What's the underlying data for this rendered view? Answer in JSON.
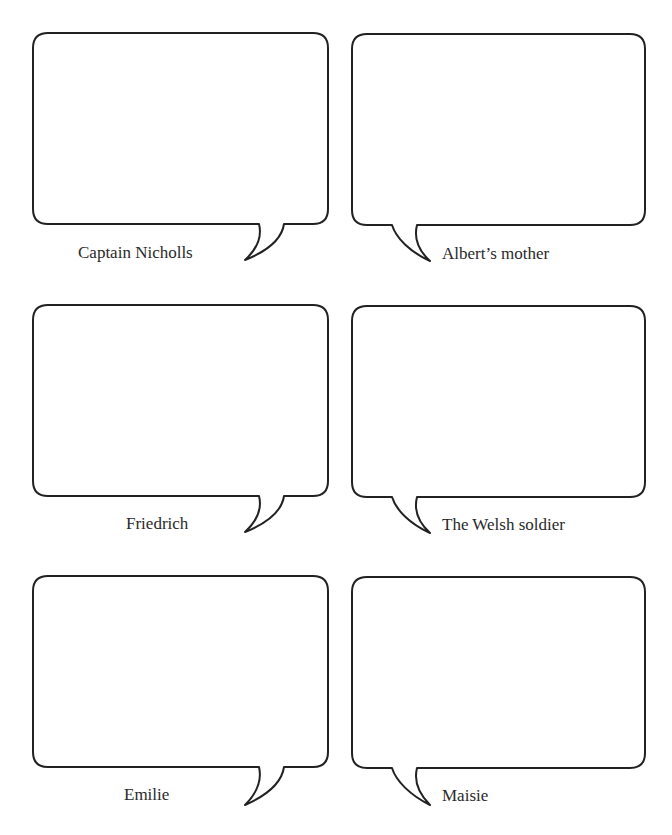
{
  "page": {
    "type": "worksheet",
    "header_remnant": ""
  },
  "style": {
    "stroke_color": "#222222",
    "background": "#ffffff",
    "text_color": "#2a2a2a"
  },
  "bubbles": [
    {
      "label": "Captain Nicholls",
      "column": "left",
      "row": 1,
      "tail": "right"
    },
    {
      "label": "Albert’s mother",
      "column": "right",
      "row": 1,
      "tail": "left"
    },
    {
      "label": "Friedrich",
      "column": "left",
      "row": 2,
      "tail": "right"
    },
    {
      "label": "The Welsh soldier",
      "column": "right",
      "row": 2,
      "tail": "left"
    },
    {
      "label": "Emilie",
      "column": "left",
      "row": 3,
      "tail": "right"
    },
    {
      "label": "Maisie",
      "column": "right",
      "row": 3,
      "tail": "left"
    }
  ]
}
